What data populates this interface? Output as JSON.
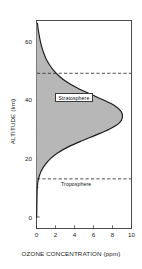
{
  "chart_data": {
    "type": "area",
    "title": "",
    "xlabel": "OZONE CONCENTRATION (ppm)",
    "ylabel": "ALTITUDE (km)",
    "xlim": [
      0,
      10
    ],
    "ylim": [
      0,
      67
    ],
    "xticks": [
      "0",
      "2",
      "4",
      "6",
      "8",
      "10"
    ],
    "xtick_values": [
      0,
      2,
      4,
      6,
      8,
      10
    ],
    "yticks": [
      "0",
      "20",
      "40",
      "60"
    ],
    "ytick_values": [
      0,
      20,
      40,
      60
    ],
    "grid": false,
    "legend": "none",
    "fill_color": "#b3b3b3",
    "line_color": "#1a1a1a",
    "series": [
      {
        "name": "Ozone concentration profile",
        "altitude_km": [
          0,
          2,
          4,
          6,
          8,
          10,
          12,
          14,
          16,
          18,
          20,
          22,
          24,
          26,
          28,
          30,
          32,
          34,
          36,
          38,
          40,
          42,
          44,
          46,
          48,
          50,
          52,
          54,
          56,
          58,
          60,
          62,
          64,
          66
        ],
        "ozone_ppm": [
          0.02,
          0.03,
          0.04,
          0.05,
          0.06,
          0.08,
          0.15,
          0.3,
          0.55,
          0.95,
          1.5,
          2.3,
          3.4,
          4.8,
          6.3,
          7.7,
          8.7,
          9.05,
          8.9,
          8.2,
          7.0,
          5.6,
          4.3,
          3.2,
          2.4,
          1.8,
          1.35,
          1.0,
          0.75,
          0.55,
          0.4,
          0.28,
          0.18,
          0.1
        ]
      }
    ],
    "annotations": [
      {
        "name": "stratopause-line",
        "label": "",
        "altitude_km": 49,
        "style": "dashed-horizontal"
      },
      {
        "name": "tropopause-line",
        "label": "",
        "altitude_km": 13,
        "style": "dashed-horizontal"
      },
      {
        "name": "stratosphere-label",
        "label": "Stratosphere",
        "altitude_km": 41
      },
      {
        "name": "troposphere-label",
        "label": "Troposphere",
        "altitude_km": 11
      }
    ]
  },
  "labels": {
    "x_axis_title": "OZONE CONCENTRATION (ppm)",
    "y_axis_title": "ALTITUDE (km)",
    "stratosphere": "Stratosphere",
    "troposphere": "Troposphere",
    "xtick_0": "0",
    "xtick_1": "2",
    "xtick_2": "4",
    "xtick_3": "6",
    "xtick_4": "8",
    "xtick_5": "10",
    "ytick_0": "0",
    "ytick_1": "20",
    "ytick_2": "40",
    "ytick_3": "60"
  }
}
